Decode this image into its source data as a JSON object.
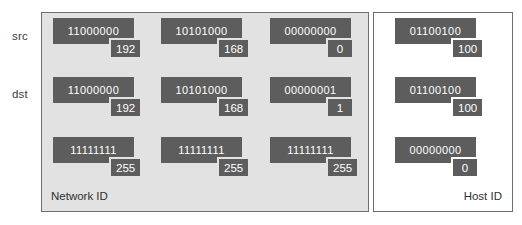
{
  "diagram": {
    "colors": {
      "byte_box": "#5d5d5d",
      "badge": "#5d5d5d",
      "network_panel_bg": "#e2e2e2",
      "host_panel_bg": "#ffffff",
      "panel_border": "#6f6f6f",
      "byte_text": "#ffffff",
      "label_text": "#3a3a3a"
    }
  },
  "row_labels": [
    {
      "id": "src",
      "label": "src"
    },
    {
      "id": "dst",
      "label": "dst"
    }
  ],
  "panels": {
    "network": {
      "caption": "Network ID",
      "rows": [
        {
          "row_id": "src",
          "octets": [
            {
              "binary": "11000000",
              "decimal": "192"
            },
            {
              "binary": "10101000",
              "decimal": "168"
            },
            {
              "binary": "00000000",
              "decimal": "0"
            }
          ]
        },
        {
          "row_id": "dst",
          "octets": [
            {
              "binary": "11000000",
              "decimal": "192"
            },
            {
              "binary": "10101000",
              "decimal": "168"
            },
            {
              "binary": "00000001",
              "decimal": "1"
            }
          ]
        },
        {
          "row_id": "mask",
          "octets": [
            {
              "binary": "11111111",
              "decimal": "255"
            },
            {
              "binary": "11111111",
              "decimal": "255"
            },
            {
              "binary": "11111111",
              "decimal": "255"
            }
          ]
        }
      ]
    },
    "host": {
      "caption": "Host ID",
      "rows": [
        {
          "row_id": "src",
          "octets": [
            {
              "binary": "01100100",
              "decimal": "100"
            }
          ]
        },
        {
          "row_id": "dst",
          "octets": [
            {
              "binary": "01100100",
              "decimal": "100"
            }
          ]
        },
        {
          "row_id": "mask",
          "octets": [
            {
              "binary": "00000000",
              "decimal": "0"
            }
          ]
        }
      ]
    }
  }
}
